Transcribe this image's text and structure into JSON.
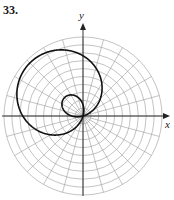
{
  "problem": {
    "number": "33."
  },
  "axes": {
    "x_label": "x",
    "y_label": "y"
  },
  "chart_data": {
    "type": "line",
    "subtype": "polar",
    "title": "33.",
    "xlabel": "x",
    "ylabel": "y",
    "grid": {
      "coordinate_system": "polar",
      "concentric_circles": 10,
      "radial_lines_every_deg": 15,
      "visible": true
    },
    "curve": {
      "description": "Limacon with inner loop, axis of symmetry along 135 degrees (upper-left)",
      "equation_estimate": "r = 3.1 + 6.4 cos(theta - 3*pi/4)",
      "max_r": 9.5,
      "inner_loop_max_r": 3.3
    },
    "axis_range": {
      "r_max": 10
    },
    "legend": null
  },
  "style": {
    "grid_color": "#9a9a9a",
    "curve_color": "#111111",
    "axis_color": "#222222"
  }
}
